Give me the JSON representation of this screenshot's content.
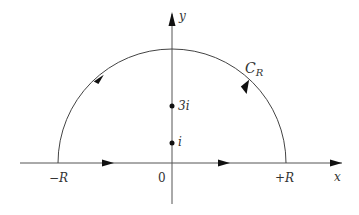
{
  "diagram": {
    "axes": {
      "x_label": "x",
      "y_label": "y",
      "origin_label": "0"
    },
    "contour": {
      "label_main": "C",
      "label_sub": "R",
      "left_endpoint_label": "−R",
      "right_endpoint_label": "+R",
      "direction": "counterclockwise"
    },
    "points": [
      {
        "label": "3i",
        "value": "3i"
      },
      {
        "label": "i",
        "value": "i"
      }
    ],
    "colors": {
      "stroke": "#333333",
      "background": "#ffffff"
    }
  }
}
